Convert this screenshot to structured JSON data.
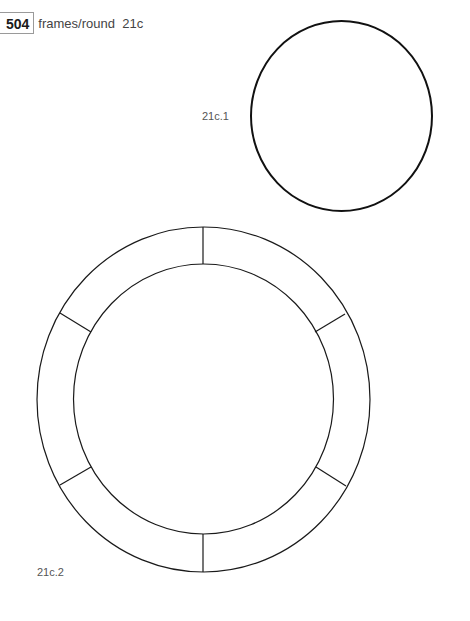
{
  "header": {
    "page_number": "504",
    "running_head": "frames/round  21c"
  },
  "figures": [
    {
      "id": "21c.1",
      "label": "21c.1",
      "shape": "circle-frame",
      "stroke_color": "#111111",
      "stroke_width": 2
    },
    {
      "id": "21c.2",
      "label": "21c.2",
      "shape": "segmented-ring-frame",
      "segments": 6,
      "stroke_color": "#1a1a1a",
      "stroke_width": 1.2
    }
  ]
}
